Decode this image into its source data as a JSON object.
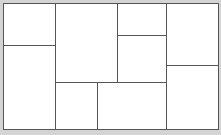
{
  "diagram": {
    "type": "rectangular-partition",
    "background_color": "#d4d4d4",
    "canvas_color": "#ffffff",
    "line_color": "#555555",
    "cells": [
      {
        "id": "a",
        "x": 0,
        "y": 0,
        "w": 52,
        "h": 42
      },
      {
        "id": "b",
        "x": 0,
        "y": 42,
        "w": 52,
        "h": 84
      },
      {
        "id": "c",
        "x": 52,
        "y": 0,
        "w": 62,
        "h": 79
      },
      {
        "id": "d",
        "x": 114,
        "y": 0,
        "w": 49,
        "h": 32
      },
      {
        "id": "e",
        "x": 114,
        "y": 32,
        "w": 49,
        "h": 47
      },
      {
        "id": "f",
        "x": 52,
        "y": 79,
        "w": 42,
        "h": 47
      },
      {
        "id": "g",
        "x": 94,
        "y": 79,
        "w": 69,
        "h": 47
      },
      {
        "id": "h",
        "x": 163,
        "y": 0,
        "w": 52,
        "h": 62
      },
      {
        "id": "i",
        "x": 163,
        "y": 62,
        "w": 52,
        "h": 64
      }
    ]
  }
}
